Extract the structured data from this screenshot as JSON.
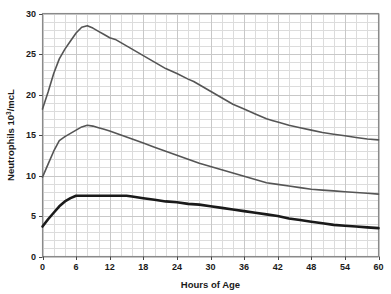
{
  "chart_data": {
    "type": "line",
    "title": "",
    "subtitle": "",
    "xlabel": "Hours of Age",
    "ylabel": "Neutrophils 10",
    "ylabel_superscript": "3",
    "ylabel_suffix": "/mcL",
    "ylabel_full": "Neutrophils 10³/mcL",
    "xlim": [
      0,
      60
    ],
    "ylim": [
      0,
      30
    ],
    "xticks": [
      0,
      6,
      12,
      18,
      24,
      30,
      36,
      42,
      48,
      54,
      60
    ],
    "yticks": [
      0,
      5,
      10,
      15,
      20,
      25,
      30
    ],
    "xtick_labels": [
      "0",
      "6",
      "12",
      "18",
      "24",
      "30",
      "36",
      "42",
      "48",
      "54",
      "60"
    ],
    "ytick_labels": [
      "0",
      "5",
      "10",
      "15",
      "20",
      "25",
      "30"
    ],
    "x_minor_step": 2,
    "y_minor_step": 1,
    "grid": true,
    "grid_color": "#c8c8c8",
    "grid_minor_color": "#dcdcdc",
    "frame_color": "#8a8a8a",
    "legend": false,
    "legend_position": "none",
    "series": [
      {
        "name": "upper-limit-curve",
        "color": "#555555",
        "width": 1.6,
        "points": [
          [
            0,
            18.2
          ],
          [
            1,
            20.3
          ],
          [
            2,
            22.6
          ],
          [
            3,
            24.4
          ],
          [
            4,
            25.6
          ],
          [
            5,
            26.6
          ],
          [
            6,
            27.6
          ],
          [
            7,
            28.3
          ],
          [
            8,
            28.5
          ],
          [
            9,
            28.2
          ],
          [
            10,
            27.8
          ],
          [
            11,
            27.4
          ],
          [
            12,
            27.0
          ],
          [
            13,
            26.8
          ],
          [
            14,
            26.4
          ],
          [
            16,
            25.6
          ],
          [
            18,
            24.8
          ],
          [
            20,
            24.0
          ],
          [
            22,
            23.2
          ],
          [
            24,
            22.6
          ],
          [
            26,
            21.9
          ],
          [
            27,
            21.6
          ],
          [
            28,
            21.2
          ],
          [
            30,
            20.4
          ],
          [
            32,
            19.6
          ],
          [
            34,
            18.8
          ],
          [
            36,
            18.2
          ],
          [
            38,
            17.6
          ],
          [
            40,
            17.0
          ],
          [
            41,
            16.8
          ],
          [
            42,
            16.6
          ],
          [
            44,
            16.2
          ],
          [
            46,
            15.9
          ],
          [
            48,
            15.6
          ],
          [
            50,
            15.3
          ],
          [
            52,
            15.1
          ],
          [
            54,
            14.9
          ],
          [
            56,
            14.7
          ],
          [
            58,
            14.5
          ],
          [
            60,
            14.4
          ]
        ]
      },
      {
        "name": "mean-curve",
        "color": "#555555",
        "width": 1.6,
        "points": [
          [
            0,
            9.8
          ],
          [
            1,
            11.4
          ],
          [
            2,
            13.0
          ],
          [
            3,
            14.3
          ],
          [
            4,
            14.8
          ],
          [
            5,
            15.2
          ],
          [
            6,
            15.6
          ],
          [
            7,
            16.0
          ],
          [
            8,
            16.2
          ],
          [
            9,
            16.1
          ],
          [
            10,
            15.9
          ],
          [
            11,
            15.7
          ],
          [
            12,
            15.5
          ],
          [
            14,
            15.0
          ],
          [
            16,
            14.5
          ],
          [
            18,
            14.0
          ],
          [
            20,
            13.5
          ],
          [
            22,
            13.0
          ],
          [
            24,
            12.5
          ],
          [
            26,
            12.0
          ],
          [
            28,
            11.5
          ],
          [
            30,
            11.1
          ],
          [
            32,
            10.7
          ],
          [
            34,
            10.3
          ],
          [
            36,
            9.9
          ],
          [
            38,
            9.5
          ],
          [
            40,
            9.1
          ],
          [
            42,
            8.9
          ],
          [
            44,
            8.7
          ],
          [
            46,
            8.5
          ],
          [
            48,
            8.3
          ],
          [
            50,
            8.2
          ],
          [
            52,
            8.1
          ],
          [
            54,
            8.0
          ],
          [
            56,
            7.9
          ],
          [
            58,
            7.8
          ],
          [
            60,
            7.7
          ]
        ]
      },
      {
        "name": "lower-limit-curve",
        "color": "#1a1a1a",
        "width": 2.6,
        "points": [
          [
            0,
            3.7
          ],
          [
            1,
            4.6
          ],
          [
            2,
            5.4
          ],
          [
            3,
            6.2
          ],
          [
            4,
            6.8
          ],
          [
            5,
            7.2
          ],
          [
            6,
            7.5
          ],
          [
            8,
            7.5
          ],
          [
            10,
            7.5
          ],
          [
            12,
            7.5
          ],
          [
            14,
            7.5
          ],
          [
            15,
            7.5
          ],
          [
            16,
            7.4
          ],
          [
            18,
            7.2
          ],
          [
            20,
            7.0
          ],
          [
            22,
            6.8
          ],
          [
            24,
            6.7
          ],
          [
            26,
            6.5
          ],
          [
            28,
            6.4
          ],
          [
            30,
            6.2
          ],
          [
            32,
            6.0
          ],
          [
            34,
            5.8
          ],
          [
            36,
            5.6
          ],
          [
            38,
            5.4
          ],
          [
            40,
            5.2
          ],
          [
            42,
            5.0
          ],
          [
            44,
            4.7
          ],
          [
            46,
            4.5
          ],
          [
            48,
            4.3
          ],
          [
            50,
            4.1
          ],
          [
            52,
            3.9
          ],
          [
            54,
            3.8
          ],
          [
            56,
            3.7
          ],
          [
            58,
            3.6
          ],
          [
            60,
            3.5
          ]
        ]
      }
    ]
  }
}
